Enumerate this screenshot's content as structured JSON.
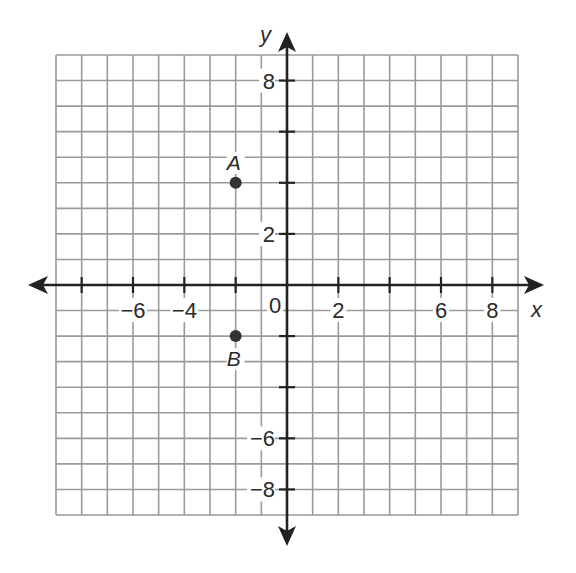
{
  "chart_data": {
    "type": "scatter",
    "title": "",
    "xlabel": "x",
    "ylabel": "y",
    "xlim": [
      -9,
      9
    ],
    "ylim": [
      -9,
      9
    ],
    "grid": true,
    "grid_step": 1,
    "tick_step": 2,
    "origin_label": "0",
    "x_tick_labels": [
      {
        "value": -6,
        "label": "−6"
      },
      {
        "value": -4,
        "label": "−4"
      },
      {
        "value": 2,
        "label": "2"
      },
      {
        "value": 6,
        "label": "6"
      },
      {
        "value": 8,
        "label": "8"
      }
    ],
    "y_tick_labels": [
      {
        "value": 8,
        "label": "8"
      },
      {
        "value": 2,
        "label": "2"
      },
      {
        "value": -6,
        "label": "−6"
      },
      {
        "value": -8,
        "label": "−8"
      }
    ],
    "points": [
      {
        "name": "A",
        "x": -2,
        "y": 4,
        "label_position": "above"
      },
      {
        "name": "B",
        "x": -2,
        "y": -2,
        "label_position": "below"
      }
    ],
    "colors": {
      "grid": "#9a9a9a",
      "axis": "#222222",
      "point": "#333333"
    }
  }
}
